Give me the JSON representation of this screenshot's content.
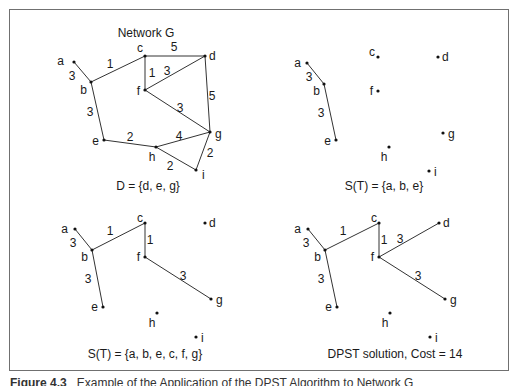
{
  "figure": {
    "caption_label": "Figure 4.3",
    "caption_text": "Example of the Application of the DPST Algorithm to Network G"
  },
  "panels": [
    {
      "id": "network-g",
      "title": "Network G",
      "title_pos": [
        146,
        37
      ],
      "caption": "D = {d, e, g}",
      "caption_pos": [
        148,
        190
      ],
      "nodes": {
        "a": {
          "x": 74,
          "y": 62,
          "lx": -10,
          "ly": 3,
          "anchor": "end"
        },
        "b": {
          "x": 91,
          "y": 82,
          "lx": -4,
          "ly": 12,
          "anchor": "end"
        },
        "c": {
          "x": 145,
          "y": 56,
          "lx": -2,
          "ly": -4,
          "anchor": "end"
        },
        "d": {
          "x": 205,
          "y": 56,
          "lx": 4,
          "ly": 4,
          "anchor": "start"
        },
        "f": {
          "x": 145,
          "y": 90,
          "lx": -5,
          "ly": 5,
          "anchor": "end"
        },
        "g": {
          "x": 210,
          "y": 132,
          "lx": 5,
          "ly": 6,
          "anchor": "start"
        },
        "e": {
          "x": 104,
          "y": 140,
          "lx": -5,
          "ly": 5,
          "anchor": "end"
        },
        "h": {
          "x": 156,
          "y": 147,
          "lx": -4,
          "ly": 14,
          "anchor": "middle"
        },
        "i": {
          "x": 196,
          "y": 170,
          "lx": 6,
          "ly": 9,
          "anchor": "start"
        }
      },
      "edges": [
        {
          "from": "a",
          "to": "b",
          "w": "3",
          "lx": 72,
          "ly": 80
        },
        {
          "from": "b",
          "to": "c",
          "w": "1",
          "lx": 110,
          "ly": 68
        },
        {
          "from": "c",
          "to": "d",
          "w": "5",
          "lx": 174,
          "ly": 51
        },
        {
          "from": "c",
          "to": "f",
          "w": "1",
          "lx": 152,
          "ly": 77
        },
        {
          "from": "f",
          "to": "d",
          "w": "3",
          "lx": 167,
          "ly": 75
        },
        {
          "from": "d",
          "to": "g",
          "w": "5",
          "lx": 212,
          "ly": 100
        },
        {
          "from": "f",
          "to": "g",
          "w": "3",
          "lx": 180,
          "ly": 112
        },
        {
          "from": "b",
          "to": "e",
          "w": "3",
          "lx": 90,
          "ly": 116
        },
        {
          "from": "e",
          "to": "h",
          "w": "2",
          "lx": 130,
          "ly": 141
        },
        {
          "from": "h",
          "to": "g",
          "w": "4",
          "lx": 179,
          "ly": 140
        },
        {
          "from": "h",
          "to": "i",
          "w": "2",
          "lx": 170,
          "ly": 170
        },
        {
          "from": "g",
          "to": "i",
          "w": "2",
          "lx": 210,
          "ly": 157
        }
      ]
    },
    {
      "id": "st-abe",
      "title": "",
      "caption": "S(T) = {a, b, e}",
      "caption_pos": [
        384,
        190
      ],
      "nodes": {
        "a": {
          "x": 307,
          "y": 63,
          "lx": -6,
          "ly": 4,
          "anchor": "end"
        },
        "b": {
          "x": 324,
          "y": 84,
          "lx": -4,
          "ly": 11,
          "anchor": "end"
        },
        "c": {
          "x": 378,
          "y": 57,
          "lx": -3,
          "ly": -1,
          "anchor": "end"
        },
        "d": {
          "x": 438,
          "y": 57,
          "lx": 4,
          "ly": 4,
          "anchor": "start"
        },
        "f": {
          "x": 378,
          "y": 91,
          "lx": -5,
          "ly": 4,
          "anchor": "end"
        },
        "g": {
          "x": 443,
          "y": 133,
          "lx": 5,
          "ly": 5,
          "anchor": "start"
        },
        "e": {
          "x": 336,
          "y": 140,
          "lx": -5,
          "ly": 5,
          "anchor": "end"
        },
        "h": {
          "x": 389,
          "y": 147,
          "lx": -5,
          "ly": 14,
          "anchor": "middle"
        },
        "i": {
          "x": 429,
          "y": 171,
          "lx": 5,
          "ly": 5,
          "anchor": "start"
        }
      },
      "edges": [
        {
          "from": "a",
          "to": "b",
          "w": "3",
          "lx": 309,
          "ly": 81
        },
        {
          "from": "b",
          "to": "e",
          "w": "3",
          "lx": 321,
          "ly": 117
        }
      ]
    },
    {
      "id": "st-abecfg",
      "title": "",
      "caption": "S(T) = {a, b, e, c, f, g}",
      "caption_pos": [
        145,
        358
      ],
      "nodes": {
        "a": {
          "x": 75,
          "y": 229,
          "lx": -7,
          "ly": 4,
          "anchor": "end"
        },
        "b": {
          "x": 92,
          "y": 250,
          "lx": -4,
          "ly": 11,
          "anchor": "end"
        },
        "c": {
          "x": 145,
          "y": 223,
          "lx": -2,
          "ly": -1,
          "anchor": "end"
        },
        "d": {
          "x": 205,
          "y": 223,
          "lx": 4,
          "ly": 4,
          "anchor": "start"
        },
        "f": {
          "x": 145,
          "y": 257,
          "lx": -5,
          "ly": 4,
          "anchor": "end"
        },
        "g": {
          "x": 211,
          "y": 299,
          "lx": 5,
          "ly": 5,
          "anchor": "start"
        },
        "e": {
          "x": 103,
          "y": 307,
          "lx": -5,
          "ly": 4,
          "anchor": "end"
        },
        "h": {
          "x": 157,
          "y": 313,
          "lx": -5,
          "ly": 14,
          "anchor": "middle"
        },
        "i": {
          "x": 196,
          "y": 337,
          "lx": 5,
          "ly": 5,
          "anchor": "start"
        }
      },
      "edges": [
        {
          "from": "a",
          "to": "b",
          "w": "3",
          "lx": 73,
          "ly": 247
        },
        {
          "from": "b",
          "to": "c",
          "w": "1",
          "lx": 110,
          "ly": 235
        },
        {
          "from": "c",
          "to": "f",
          "w": "1",
          "lx": 150,
          "ly": 244
        },
        {
          "from": "f",
          "to": "g",
          "w": "3",
          "lx": 183,
          "ly": 280
        },
        {
          "from": "b",
          "to": "e",
          "w": "3",
          "lx": 88,
          "ly": 283
        }
      ]
    },
    {
      "id": "dpst-solution",
      "title": "",
      "caption": "DPST solution, Cost = 14",
      "caption_pos": [
        395,
        358
      ],
      "nodes": {
        "a": {
          "x": 308,
          "y": 229,
          "lx": -7,
          "ly": 4,
          "anchor": "end"
        },
        "b": {
          "x": 325,
          "y": 250,
          "lx": -4,
          "ly": 11,
          "anchor": "end"
        },
        "c": {
          "x": 379,
          "y": 223,
          "lx": -2,
          "ly": -1,
          "anchor": "end"
        },
        "d": {
          "x": 439,
          "y": 223,
          "lx": 4,
          "ly": 4,
          "anchor": "start"
        },
        "f": {
          "x": 379,
          "y": 257,
          "lx": -5,
          "ly": 4,
          "anchor": "end"
        },
        "g": {
          "x": 445,
          "y": 299,
          "lx": 5,
          "ly": 5,
          "anchor": "start"
        },
        "e": {
          "x": 337,
          "y": 307,
          "lx": -5,
          "ly": 4,
          "anchor": "end"
        },
        "h": {
          "x": 390,
          "y": 313,
          "lx": -5,
          "ly": 14,
          "anchor": "middle"
        },
        "i": {
          "x": 430,
          "y": 337,
          "lx": 5,
          "ly": 5,
          "anchor": "start"
        }
      },
      "edges": [
        {
          "from": "a",
          "to": "b",
          "w": "3",
          "lx": 306,
          "ly": 247
        },
        {
          "from": "b",
          "to": "c",
          "w": "1",
          "lx": 343,
          "ly": 235
        },
        {
          "from": "c",
          "to": "f",
          "w": "1",
          "lx": 384,
          "ly": 244
        },
        {
          "from": "f",
          "to": "d",
          "w": "3",
          "lx": 400,
          "ly": 243
        },
        {
          "from": "f",
          "to": "g",
          "w": "3",
          "lx": 418,
          "ly": 280
        },
        {
          "from": "b",
          "to": "e",
          "w": "3",
          "lx": 321,
          "ly": 283
        }
      ]
    }
  ],
  "colors": {
    "edge": "#333333",
    "node": "#111111",
    "text": "#1a1a1a",
    "frame": "#707070"
  }
}
